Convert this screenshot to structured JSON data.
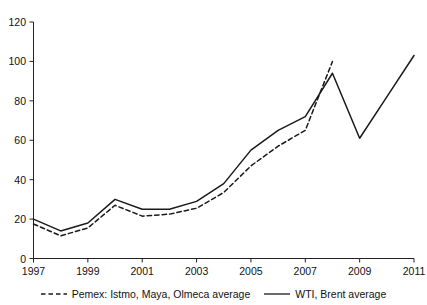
{
  "chart_data": {
    "type": "line",
    "title": "",
    "xlabel": "",
    "ylabel": "",
    "xlim": [
      1997,
      2011
    ],
    "ylim": [
      0,
      120
    ],
    "grid": false,
    "legend_position": "bottom",
    "x": [
      1997,
      1998,
      1999,
      2000,
      2001,
      2002,
      2003,
      2004,
      2005,
      2006,
      2007,
      2008,
      2009,
      2010,
      2011
    ],
    "xticks": [
      "1997",
      "1999",
      "2001",
      "2003",
      "2005",
      "2007",
      "2009",
      "2011"
    ],
    "yticks": [
      "0",
      "20",
      "40",
      "60",
      "80",
      "100",
      "120"
    ],
    "series": [
      {
        "name": "Pemex: Istmo, Maya, Olmeca average",
        "style": "dashed",
        "color": "#1a1a1a",
        "x": [
          1997,
          1998,
          1999,
          2000,
          2001,
          2002,
          2003,
          2004,
          2005,
          2006,
          2007,
          2008
        ],
        "values": [
          17.5,
          11.5,
          15.5,
          27.0,
          21.5,
          22.5,
          25.5,
          33.5,
          47.0,
          57.0,
          65.0,
          100.0
        ]
      },
      {
        "name": "WTI, Brent average",
        "style": "solid",
        "color": "#1a1a1a",
        "x": [
          1997,
          1998,
          1999,
          2000,
          2001,
          2002,
          2003,
          2004,
          2005,
          2006,
          2007,
          2008,
          2009,
          2010,
          2011
        ],
        "values": [
          20.0,
          14.0,
          18.0,
          30.0,
          25.0,
          25.0,
          29.0,
          38.0,
          55.0,
          65.0,
          72.0,
          94.0,
          61.0,
          82.0,
          103.0
        ]
      }
    ]
  },
  "legend": {
    "entries": [
      {
        "label": "Pemex: Istmo, Maya, Olmeca average",
        "style": "dashed"
      },
      {
        "label": "WTI, Brent average",
        "style": "solid"
      }
    ]
  }
}
